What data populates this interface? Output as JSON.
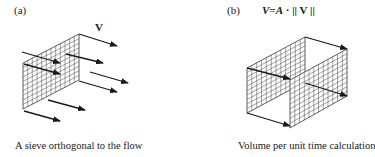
{
  "panel_a": {
    "tag": "(a)",
    "vector_label": "V",
    "caption": "A sieve orthogonal to the flow",
    "icons": {
      "sieve": "grid-mesh-icon",
      "flow": "arrow-right-icon"
    }
  },
  "panel_b": {
    "tag": "(b)",
    "formula": {
      "lhs": "V",
      "equals": "=",
      "area": "A",
      "dot": "·",
      "norm_open": "||",
      "vector": "V",
      "norm_close": "||"
    },
    "caption": "Volume per unit time calculation",
    "icons": {
      "sieve": "grid-mesh-icon",
      "flow": "arrow-right-icon"
    }
  },
  "colors": {
    "ink": "#1a1a1a",
    "grid": "#4a4a4a",
    "background": "#ffffff"
  }
}
